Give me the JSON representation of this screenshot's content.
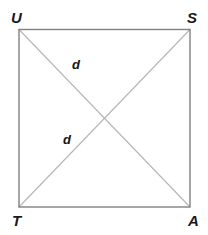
{
  "figure": {
    "background_color": "#ffffff",
    "square": {
      "name": "square-USAT",
      "stroke_color": "#808080",
      "stroke_width": 1.4,
      "fill": "none",
      "left": 19,
      "top": 29.5,
      "right": 190,
      "bottom": 207
    },
    "diagonals": {
      "stroke_color": "#b5b5b5",
      "stroke_width": 1.1,
      "segments": [
        {
          "name": "diagonal-U-to-A",
          "from": "U",
          "to": "A"
        },
        {
          "name": "diagonal-S-to-T",
          "from": "S",
          "to": "T"
        }
      ]
    },
    "vertices": [
      {
        "id": "U",
        "label": "U",
        "position": "top-left"
      },
      {
        "id": "S",
        "label": "S",
        "position": "top-right"
      },
      {
        "id": "T",
        "label": "T",
        "position": "bottom-left"
      },
      {
        "id": "A",
        "label": "A",
        "position": "bottom-right"
      }
    ],
    "measure_labels": [
      {
        "id": "d-upper",
        "label": "d",
        "on": "diagonal-U-to-A"
      },
      {
        "id": "d-lower",
        "label": "d",
        "on": "diagonal-S-to-T"
      }
    ]
  }
}
